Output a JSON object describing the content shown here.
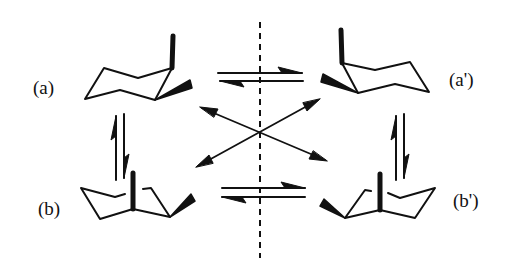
{
  "diagram": {
    "labels": {
      "a": "(a)",
      "a_prime": "(a')",
      "b": "(b)",
      "b_prime": "(b')"
    },
    "nodes": [
      {
        "id": "a",
        "label": "(a)",
        "description": "chair conformer with axial and equatorial wedge substituents on right carbons"
      },
      {
        "id": "a_prime",
        "label": "(a')",
        "description": "mirror image of (a)"
      },
      {
        "id": "b",
        "label": "(b)",
        "description": "ring-flipped chair with axial substituent and equatorial wedge"
      },
      {
        "id": "b_prime",
        "label": "(b')",
        "description": "mirror image of (b)"
      }
    ],
    "edges": [
      {
        "from": "a",
        "to": "a_prime",
        "type": "equilibrium"
      },
      {
        "from": "b",
        "to": "b_prime",
        "type": "equilibrium"
      },
      {
        "from": "a",
        "to": "b",
        "type": "equilibrium"
      },
      {
        "from": "a_prime",
        "to": "b_prime",
        "type": "equilibrium"
      },
      {
        "from": "a",
        "to": "b_prime",
        "type": "double-headed"
      },
      {
        "from": "a_prime",
        "to": "b",
        "type": "double-headed"
      }
    ],
    "mirror_plane": "vertical dashed line",
    "colors": {
      "ink": "#111111",
      "background": "#ffffff"
    }
  }
}
